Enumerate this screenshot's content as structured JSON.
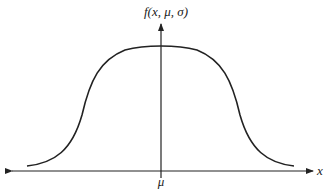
{
  "diagram": {
    "type": "bell-shaped curve (flat-topped)",
    "y_axis_label": "f(x, μ, σ)",
    "x_axis_label": "x",
    "center_label": "μ",
    "colors": {
      "stroke": "#222222",
      "background": "#ffffff"
    }
  }
}
